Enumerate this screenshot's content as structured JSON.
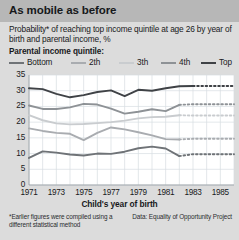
{
  "title": "As mobile as before",
  "subtitle": "Probability* of reaching top income quintile at age 26 by year of birth and parental income, %",
  "legend_title": "Parental income quintile:",
  "footnote": "*Earlier figures were compiled using a different statistical method",
  "source": "Data: Equality of Opportunity Project",
  "colors": {
    "top": "#3f4246",
    "fourth": "#8e9296",
    "third": "#c9cccf",
    "second": "#a9acb0",
    "bottom": "#6f7377",
    "title_band": "#b7b7b7",
    "page_bg": "#dcdcdc",
    "plot_bg": "#ffffff",
    "grid": "#d7dce1",
    "text": "#18191b"
  },
  "chart_data": {
    "type": "line",
    "title": "As mobile as before",
    "subtitle": "Probability* of reaching top income quintile at age 26 by year of birth and parental income, %",
    "xlabel": "Child's year of birth",
    "ylabel": "",
    "xlim": [
      1971,
      1986
    ],
    "ylim": [
      0,
      35
    ],
    "ytick_values": [
      0,
      5,
      10,
      15,
      20,
      25,
      30,
      35
    ],
    "xtick_values": [
      1971,
      1973,
      1975,
      1977,
      1979,
      1981,
      1983,
      1985
    ],
    "grid": true,
    "legend_position": "top",
    "solid_through_year": 1982,
    "dotted_note": "values from 1982 onward are shown as dotted projections",
    "x": [
      1971,
      1972,
      1973,
      1974,
      1975,
      1976,
      1977,
      1978,
      1979,
      1980,
      1981,
      1982,
      1983,
      1984,
      1985,
      1986
    ],
    "series": [
      {
        "name": "Top",
        "color": "#3f4246",
        "values": [
          30.8,
          30.5,
          29.0,
          27.9,
          28.6,
          29.6,
          30.1,
          28.3,
          30.3,
          30.0,
          30.8,
          31.4,
          31.5,
          31.5,
          31.5,
          31.5
        ],
        "dotted_from_index": 12
      },
      {
        "name": "4th",
        "color": "#8e9296",
        "values": [
          25.3,
          24.2,
          24.2,
          24.7,
          25.8,
          25.6,
          24.3,
          22.7,
          23.3,
          24.1,
          23.5,
          25.5,
          25.7,
          25.7,
          25.7,
          25.7
        ],
        "dotted_from_index": 11
      },
      {
        "name": "3th",
        "color": "#c9cccf",
        "values": [
          22.2,
          20.6,
          19.6,
          19.3,
          19.4,
          19.7,
          20.0,
          20.5,
          21.2,
          21.6,
          21.7,
          22.2,
          22.1,
          22.1,
          22.1,
          22.1
        ],
        "dotted_from_index": 11
      },
      {
        "name": "2th",
        "color": "#a9acb0",
        "values": [
          18.0,
          17.2,
          16.6,
          16.3,
          14.3,
          16.6,
          18.3,
          17.7,
          16.8,
          15.8,
          14.6,
          14.5,
          14.7,
          14.7,
          14.7,
          14.7
        ],
        "dotted_from_index": 11
      },
      {
        "name": "Bottom",
        "color": "#6f7377",
        "values": [
          8.6,
          10.7,
          10.3,
          9.7,
          9.4,
          10.0,
          9.9,
          10.6,
          11.7,
          12.2,
          11.6,
          9.2,
          9.8,
          9.8,
          9.8,
          9.8
        ],
        "dotted_from_index": 11
      }
    ],
    "legend_order": [
      "Bottom",
      "2th",
      "3th",
      "4th",
      "Top"
    ]
  }
}
